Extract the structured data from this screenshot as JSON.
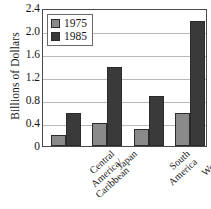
{
  "chart_data": {
    "type": "bar",
    "title": "",
    "xlabel": "",
    "ylabel": "Billions of Dollars",
    "ylim": [
      0,
      2.4
    ],
    "yticks": [
      "0",
      "0.4",
      "0.8",
      "1.2",
      "1.6",
      "2.0",
      "2.4"
    ],
    "ytick_values": [
      0,
      0.4,
      0.8,
      1.2,
      1.6,
      2.0,
      2.4
    ],
    "grid": true,
    "legend_position": "upper-left",
    "categories": [
      "Central America/ Caribbean",
      "Japan",
      "South America",
      "Western Europe"
    ],
    "category_lines": [
      [
        "Central",
        "America/",
        "Caribbean"
      ],
      [
        "Japan"
      ],
      [
        "South",
        "America"
      ],
      [
        "Western",
        "Europe"
      ]
    ],
    "series": [
      {
        "name": "1975",
        "color": "#8a8a8a",
        "values": [
          0.19,
          0.4,
          0.29,
          0.58
        ]
      },
      {
        "name": "1985",
        "color": "#3a3a3a",
        "values": [
          0.58,
          1.37,
          0.87,
          2.18
        ]
      }
    ]
  }
}
